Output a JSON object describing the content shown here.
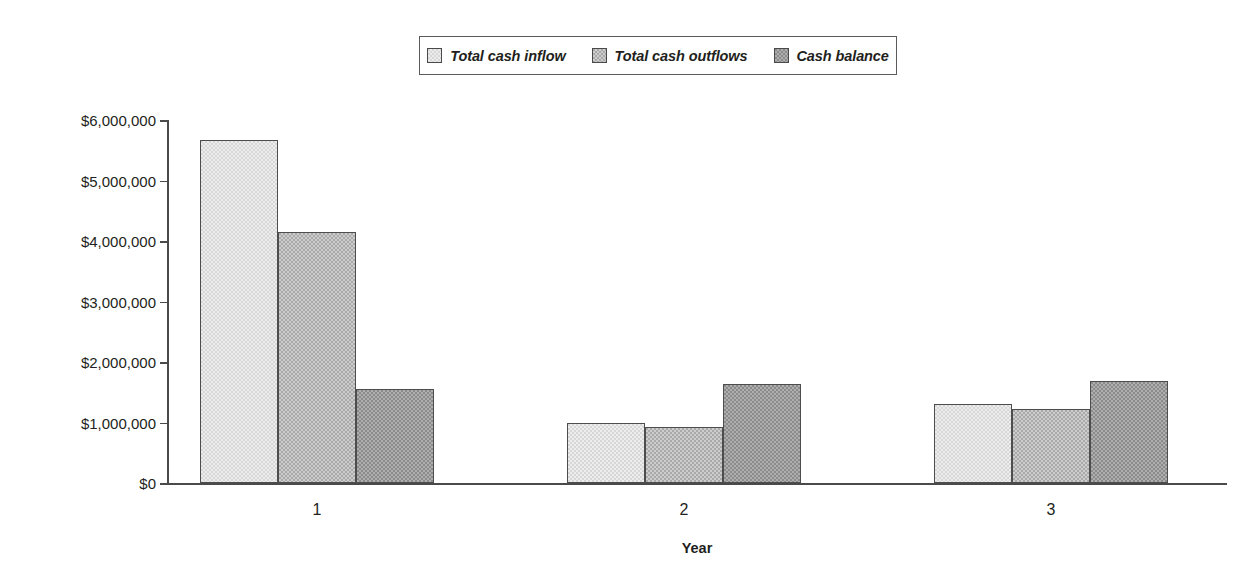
{
  "chart_data": {
    "type": "bar",
    "title": "",
    "subtitle": "",
    "xlabel": "Year",
    "ylabel": "",
    "categories": [
      "1",
      "2",
      "3"
    ],
    "series": [
      {
        "name": "Total cash inflow",
        "color": "#d7d7d7",
        "values": [
          5670000,
          1000000,
          1310000
        ]
      },
      {
        "name": "Total cash outflows",
        "color": "#a9a9a9",
        "values": [
          4150000,
          930000,
          1220000
        ]
      },
      {
        "name": "Cash balance",
        "color": "#8b8b8b",
        "values": [
          1550000,
          1640000,
          1690000
        ]
      }
    ],
    "ylim": [
      0,
      6000000
    ],
    "ytick_values": [
      0,
      1000000,
      2000000,
      3000000,
      4000000,
      5000000,
      6000000
    ],
    "ytick_labels": [
      "$0",
      "$1,000,000",
      "$2,000,000",
      "$3,000,000",
      "$4,000,000",
      "$5,000,000",
      "$6,000,000"
    ],
    "grid": false,
    "legend_position": "top-center",
    "legend_border_color": "#5b5b5b",
    "axis_color": "#4a4a4a",
    "bar_border_color": "#4d4d4d",
    "text_color": "#231f20",
    "background": "#ffffff"
  },
  "legend": {
    "entries": [
      {
        "label": "Total cash inflow",
        "swatch": "series-1-swatch"
      },
      {
        "label": "Total cash outflows",
        "swatch": "series-2-swatch"
      },
      {
        "label": "Cash balance",
        "swatch": "series-3-swatch"
      }
    ]
  },
  "axes": {
    "x_title": "Year",
    "x_labels": [
      "1",
      "2",
      "3"
    ],
    "y_labels": [
      "$6,000,000",
      "$5,000,000",
      "$4,000,000",
      "$3,000,000",
      "$2,000,000",
      "$1,000,000",
      "$0"
    ]
  }
}
